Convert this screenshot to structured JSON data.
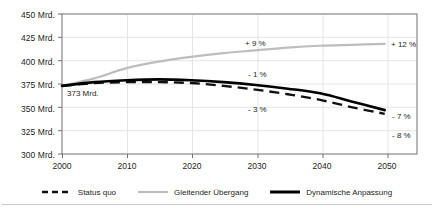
{
  "chart_data": {
    "type": "line",
    "title": "",
    "subtitle": "",
    "xlabel": "",
    "ylabel": "",
    "xlim": [
      2000,
      2055
    ],
    "ylim": [
      300,
      450
    ],
    "grid": true,
    "legend_position": "bottom-center",
    "x_ticks": [
      "2000",
      "2010",
      "2020",
      "2030",
      "2040",
      "2050"
    ],
    "x_tick_values": [
      2000,
      2010,
      2020,
      2030,
      2040,
      2050
    ],
    "y_ticks": [
      "300 Mrd.",
      "325 Mrd.",
      "350 Mrd.",
      "375 Mrd.",
      "400 Mrd.",
      "425 Mrd.",
      "450 Mrd."
    ],
    "y_tick_values": [
      300,
      325,
      350,
      375,
      400,
      425,
      450
    ],
    "unit": "Mrd.",
    "x": [
      2000,
      2005,
      2010,
      2015,
      2020,
      2025,
      2030,
      2035,
      2040,
      2045,
      2050
    ],
    "series": [
      {
        "name": "Status quo",
        "style": "dashed",
        "color": "#111111",
        "values": [
          373,
          376,
          377,
          377,
          376,
          373,
          369,
          364,
          358,
          350,
          343
        ]
      },
      {
        "name": "Gleitender Übergang",
        "style": "solid-light",
        "color": "#bdbdbd",
        "values": [
          373,
          381,
          392,
          399,
          404,
          408,
          411,
          414,
          416,
          417,
          418
        ]
      },
      {
        "name": "Dynamische Anpassung",
        "style": "solid-bold",
        "color": "#000000",
        "values": [
          373,
          377,
          379,
          380,
          379,
          377,
          374,
          370,
          365,
          356,
          347
        ]
      }
    ],
    "annotations": [
      {
        "label": "373 Mrd.",
        "x": 2001,
        "y": 367,
        "role": "start-value"
      },
      {
        "label": "+ 9 %",
        "x": 2024,
        "y": 421,
        "role": "gleitender-uebergang-mid"
      },
      {
        "label": "+ 12 %",
        "x": 2051,
        "y": 418,
        "role": "gleitender-uebergang-end"
      },
      {
        "label": "- 1 %",
        "x": 2024,
        "y": 390,
        "role": "dynamische-anpassung-mid"
      },
      {
        "label": "- 3 %",
        "x": 2024,
        "y": 369,
        "role": "status-quo-mid"
      },
      {
        "label": "- 7 %",
        "x": 2051,
        "y": 348,
        "role": "dynamische-anpassung-end"
      },
      {
        "label": "- 8 %",
        "x": 2051,
        "y": 330,
        "role": "status-quo-end"
      }
    ]
  },
  "legend": {
    "items": [
      {
        "label": "Status quo"
      },
      {
        "label": "Gleitender Übergang"
      },
      {
        "label": "Dynamische Anpassung"
      }
    ]
  },
  "colors": {
    "axis": "#6f6f6f",
    "grid": "#e2e2e2",
    "series_light": "#bdbdbd",
    "series_dark": "#000000",
    "divider": "#c8c8c8"
  }
}
